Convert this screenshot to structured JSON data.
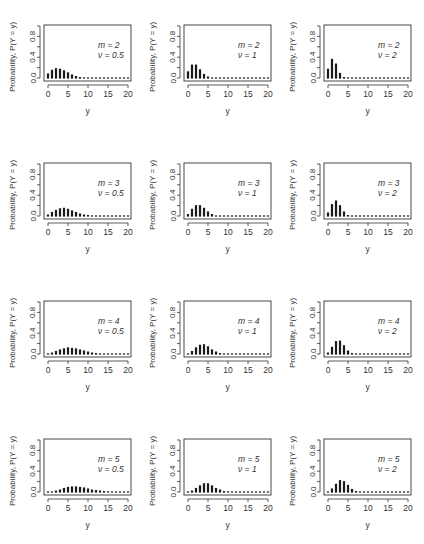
{
  "chart_data": {
    "type": "bar",
    "layout": {
      "rows": 4,
      "cols": 3,
      "grid": false,
      "legend": "none"
    },
    "xlabel": "y",
    "ylabel": "Probability, P(Y = y)",
    "xlim": [
      0,
      20
    ],
    "ylim": [
      0,
      1
    ],
    "xticks": [
      "0",
      "5",
      "10",
      "15",
      "20"
    ],
    "yticks": [
      "0.0",
      "0.4",
      "0.8"
    ],
    "x": [
      0,
      1,
      2,
      3,
      4,
      5,
      6,
      7,
      8,
      9,
      10,
      11,
      12,
      13,
      14,
      15,
      16,
      17,
      18,
      19,
      20
    ],
    "panels": [
      {
        "row": 0,
        "col": 0,
        "label_m": "m = 2",
        "label_v": "ν = 0.5",
        "values": [
          0.1,
          0.17,
          0.2,
          0.19,
          0.16,
          0.12,
          0.08,
          0.05,
          0.03,
          0.02,
          0.02,
          0.01,
          0.01,
          0.01,
          0.01,
          0.01,
          0.01,
          0.01,
          0.01,
          0.01,
          0.01
        ]
      },
      {
        "row": 0,
        "col": 1,
        "label_m": "m = 2",
        "label_v": "ν = 1",
        "values": [
          0.14,
          0.27,
          0.27,
          0.18,
          0.09,
          0.04,
          0.01,
          0.005,
          0.002,
          0.001,
          0.001,
          0.001,
          0.001,
          0.001,
          0.001,
          0.001,
          0.001,
          0.001,
          0.001,
          0.001,
          0.001
        ]
      },
      {
        "row": 0,
        "col": 2,
        "label_m": "m = 2",
        "label_v": "ν = 2",
        "values": [
          0.19,
          0.38,
          0.29,
          0.11,
          0.03,
          0.005,
          0.001,
          0.001,
          0.001,
          0.001,
          0.001,
          0.001,
          0.001,
          0.001,
          0.001,
          0.001,
          0.001,
          0.001,
          0.001,
          0.001,
          0.001
        ]
      },
      {
        "row": 1,
        "col": 0,
        "label_m": "m = 3",
        "label_v": "ν = 0.5",
        "values": [
          0.04,
          0.09,
          0.13,
          0.16,
          0.17,
          0.15,
          0.12,
          0.09,
          0.06,
          0.04,
          0.03,
          0.02,
          0.01,
          0.01,
          0.01,
          0.01,
          0.01,
          0.01,
          0.01,
          0.01,
          0.01
        ]
      },
      {
        "row": 1,
        "col": 1,
        "label_m": "m = 3",
        "label_v": "ν = 1",
        "values": [
          0.05,
          0.15,
          0.22,
          0.22,
          0.17,
          0.1,
          0.05,
          0.02,
          0.01,
          0.005,
          0.002,
          0.001,
          0.001,
          0.001,
          0.001,
          0.001,
          0.001,
          0.001,
          0.001,
          0.001,
          0.001
        ]
      },
      {
        "row": 1,
        "col": 2,
        "label_m": "m = 3",
        "label_v": "ν = 2",
        "values": [
          0.08,
          0.24,
          0.31,
          0.22,
          0.1,
          0.03,
          0.007,
          0.002,
          0.001,
          0.001,
          0.001,
          0.001,
          0.001,
          0.001,
          0.001,
          0.001,
          0.001,
          0.001,
          0.001,
          0.001,
          0.001
        ]
      },
      {
        "row": 2,
        "col": 0,
        "label_m": "m = 4",
        "label_v": "ν = 0.5",
        "values": [
          0.02,
          0.04,
          0.07,
          0.1,
          0.12,
          0.14,
          0.13,
          0.12,
          0.1,
          0.08,
          0.06,
          0.04,
          0.03,
          0.02,
          0.02,
          0.01,
          0.01,
          0.01,
          0.01,
          0.01,
          0.01
        ]
      },
      {
        "row": 2,
        "col": 1,
        "label_m": "m = 4",
        "label_v": "ν = 1",
        "values": [
          0.02,
          0.07,
          0.14,
          0.19,
          0.2,
          0.16,
          0.1,
          0.06,
          0.03,
          0.015,
          0.007,
          0.003,
          0.002,
          0.001,
          0.001,
          0.001,
          0.001,
          0.001,
          0.001,
          0.001,
          0.001
        ]
      },
      {
        "row": 2,
        "col": 2,
        "label_m": "m = 4",
        "label_v": "ν = 2",
        "values": [
          0.04,
          0.15,
          0.26,
          0.27,
          0.18,
          0.08,
          0.03,
          0.008,
          0.002,
          0.001,
          0.001,
          0.001,
          0.001,
          0.001,
          0.001,
          0.001,
          0.001,
          0.001,
          0.001,
          0.001,
          0.001
        ]
      },
      {
        "row": 3,
        "col": 0,
        "label_m": "m = 5",
        "label_v": "ν = 0.5",
        "values": [
          0.01,
          0.02,
          0.04,
          0.06,
          0.09,
          0.11,
          0.12,
          0.12,
          0.11,
          0.1,
          0.08,
          0.06,
          0.05,
          0.04,
          0.03,
          0.02,
          0.02,
          0.01,
          0.01,
          0.01,
          0.01
        ]
      },
      {
        "row": 3,
        "col": 1,
        "label_m": "m = 5",
        "label_v": "ν = 1",
        "values": [
          0.01,
          0.04,
          0.09,
          0.14,
          0.18,
          0.18,
          0.14,
          0.09,
          0.06,
          0.03,
          0.015,
          0.007,
          0.003,
          0.002,
          0.001,
          0.001,
          0.001,
          0.001,
          0.001,
          0.001,
          0.001
        ]
      },
      {
        "row": 3,
        "col": 2,
        "label_m": "m = 5",
        "label_v": "ν = 2",
        "values": [
          0.02,
          0.08,
          0.17,
          0.24,
          0.22,
          0.15,
          0.07,
          0.03,
          0.01,
          0.003,
          0.001,
          0.001,
          0.001,
          0.001,
          0.001,
          0.001,
          0.001,
          0.001,
          0.001,
          0.001,
          0.001
        ]
      }
    ]
  },
  "colors": {
    "bar": "#1a1a1a",
    "axis": "#333333",
    "text": "#333333",
    "background": "#ffffff"
  }
}
